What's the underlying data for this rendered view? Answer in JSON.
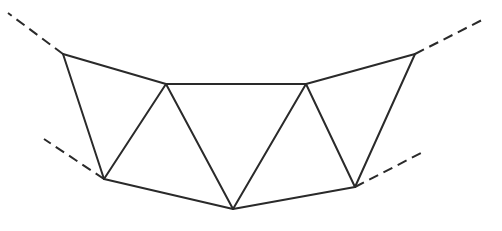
{
  "diagram": {
    "type": "truss-segment",
    "stroke_color": "#2a2a2a",
    "background": "#ffffff",
    "nodes": {
      "A": [
        63,
        54
      ],
      "B": [
        166,
        84
      ],
      "C": [
        306,
        84
      ],
      "D": [
        415,
        54
      ],
      "E": [
        104,
        179
      ],
      "F": [
        233,
        209
      ],
      "G": [
        355,
        187
      ]
    },
    "solid_edges": [
      [
        "A",
        "B"
      ],
      [
        "B",
        "C"
      ],
      [
        "C",
        "D"
      ],
      [
        "E",
        "F"
      ],
      [
        "F",
        "G"
      ],
      [
        "A",
        "E"
      ],
      [
        "E",
        "B"
      ],
      [
        "B",
        "F"
      ],
      [
        "F",
        "C"
      ],
      [
        "C",
        "G"
      ],
      [
        "G",
        "D"
      ]
    ],
    "dashed_extensions": [
      {
        "from": "A",
        "to": [
          8,
          13
        ]
      },
      {
        "from": "D",
        "to": [
          482,
          20
        ]
      },
      {
        "from": "E",
        "to": [
          44,
          139
        ]
      },
      {
        "from": "G",
        "to": [
          423,
          152
        ]
      }
    ]
  }
}
